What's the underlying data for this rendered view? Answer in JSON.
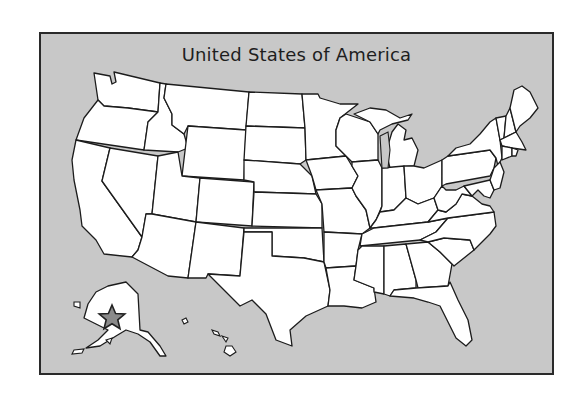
{
  "map": {
    "title": "United States of America",
    "background_color": "#c8c8c8",
    "land_color": "#ffffff",
    "border_color": "#1c1c1c",
    "marker": {
      "icon": "star-icon",
      "location": "Alaska",
      "fill": "#8a8a8a"
    },
    "regions": [
      "Contiguous United States",
      "Alaska",
      "Hawaii"
    ]
  }
}
